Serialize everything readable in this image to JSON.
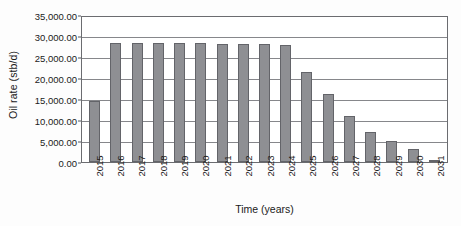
{
  "chart_data": {
    "type": "bar",
    "title": "",
    "xlabel": "Time (years)",
    "ylabel": "Oil rate (stb/d)",
    "categories": [
      "2015",
      "2016",
      "2017",
      "2018",
      "2019",
      "2020",
      "2021",
      "2022",
      "2023",
      "2024",
      "2025",
      "2026",
      "2027",
      "2028",
      "2029",
      "2030",
      "2031"
    ],
    "values": [
      14600,
      28400,
      28400,
      28350,
      28300,
      28250,
      28200,
      28150,
      28100,
      27950,
      21400,
      16200,
      11000,
      7100,
      5000,
      3000,
      300
    ],
    "series": [
      {
        "name": "Oil rate",
        "values": [
          14600,
          28400,
          28400,
          28350,
          28300,
          28250,
          28200,
          28150,
          28100,
          27950,
          21400,
          16200,
          11000,
          7100,
          5000,
          3000,
          300
        ]
      }
    ],
    "ylim": [
      0,
      35000
    ],
    "ytick_values": [
      0,
      5000,
      10000,
      15000,
      20000,
      25000,
      30000,
      35000
    ],
    "ytick_labels": [
      "0.00",
      "5,000.00",
      "10,000.00",
      "15,000.00",
      "20,000.00",
      "25,000.00",
      "30,000.00",
      "35,000.00"
    ],
    "grid": "horizontal",
    "legend": "none",
    "bar_color": "#8e8f93",
    "bar_border_color": "#636469",
    "gridline_color": "#86878b",
    "plot_border_color": "#6b6c70",
    "background_color": "#ffffff"
  }
}
